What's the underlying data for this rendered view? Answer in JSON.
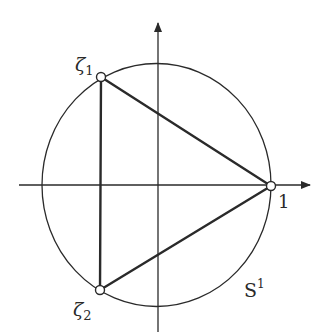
{
  "diagram": {
    "colors": {
      "stroke": "#2a2a2a",
      "background": "#ffffff"
    },
    "axes": {
      "horizontal": {
        "x1": 19,
        "x2": 310,
        "y": 185
      },
      "vertical": {
        "x": 158,
        "y1": 23,
        "y2": 332
      }
    },
    "circle": {
      "cx": 156.5,
      "cy": 185,
      "rx": 114.5,
      "ry": 121.5,
      "label": "S",
      "label_sup": "1"
    },
    "points": [
      {
        "name": "zeta1",
        "x": 101,
        "y": 77,
        "label": "ζ",
        "sub": "1"
      },
      {
        "name": "one",
        "x": 271,
        "y": 186,
        "label": "1"
      },
      {
        "name": "zeta2",
        "x": 100,
        "y": 290,
        "label": "ζ",
        "sub": "2"
      }
    ]
  }
}
